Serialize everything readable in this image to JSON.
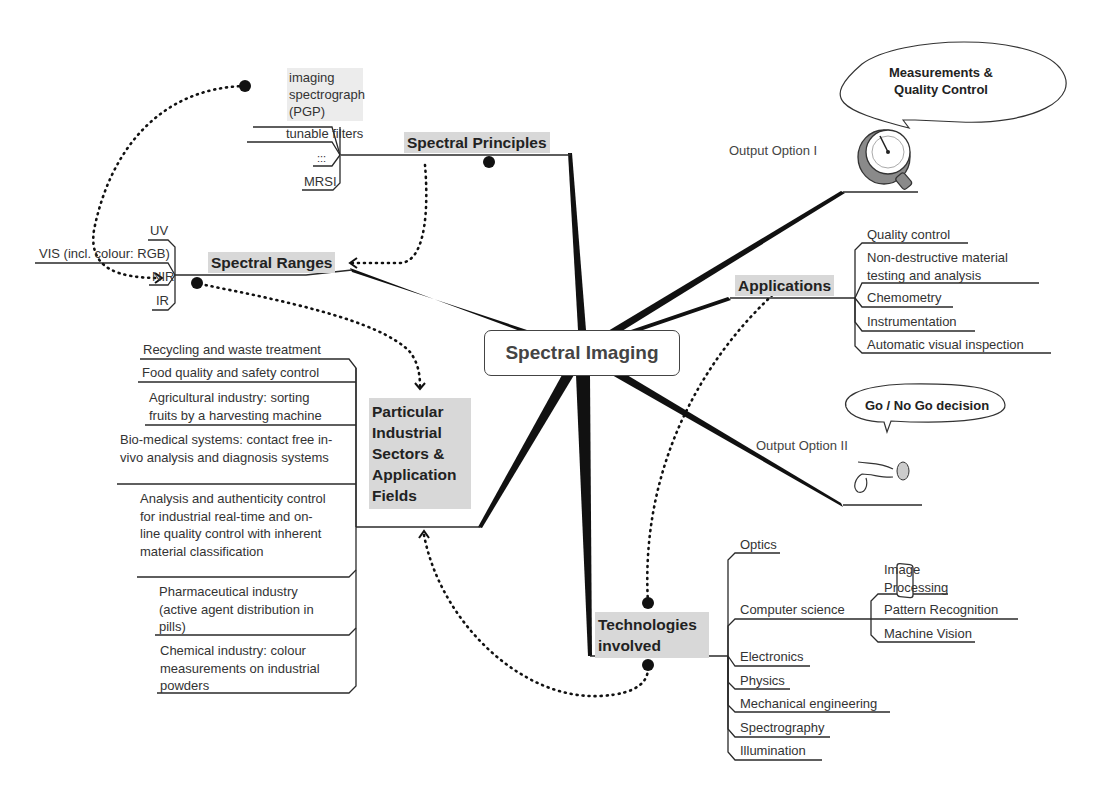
{
  "central": {
    "label": "Spectral Imaging"
  },
  "spectral_principles": {
    "label": "Spectral Principles",
    "items": [
      "imaging spectrograph (PGP)",
      "tunable filters",
      ":::",
      "MRSI"
    ]
  },
  "spectral_ranges": {
    "label": "Spectral Ranges",
    "items": [
      "UV",
      "VIS (incl. colour: RGB)",
      "NIR",
      "IR"
    ]
  },
  "sectors": {
    "label": "Particular Industrial Sectors & Application Fields",
    "items": [
      "Recycling and waste treatment",
      "Food quality and safety control",
      "Agricultural industry: sorting fruits by a harvesting machine",
      "Bio-medical systems: contact free in-vivo analysis and diagnosis systems",
      "Analysis and authenticity control for industrial real-time and on-line quality control with inherent material classification",
      "Pharmaceutical industry (active agent distribution in pills)",
      "Chemical industry: colour measurements on industrial powders"
    ]
  },
  "applications": {
    "label": "Applications",
    "items": [
      "Quality control",
      "Non-destructive material testing and analysis",
      "Chemometry",
      "Instrumentation",
      "Automatic visual inspection"
    ]
  },
  "output_option_1": {
    "label": "Output Option I",
    "bubble": "Measurements & Quality Control",
    "icon": "gauge-icon"
  },
  "output_option_2": {
    "label": "Output Option II",
    "bubble": "Go / No Go decision",
    "icon": "push-button-icon"
  },
  "technologies": {
    "label": "Technologies involved",
    "items": [
      "Optics",
      "Computer science",
      "Electronics",
      "Physics",
      "Mechanical engineering",
      "Spectrography",
      "Illumination"
    ],
    "computer_science_subitems": [
      "Image Processing",
      "Pattern Recognition",
      "Machine Vision"
    ]
  },
  "colors": {
    "line": "#2a2a2a",
    "topic_bg": "#d8d8d8",
    "spoke": "#111111"
  }
}
